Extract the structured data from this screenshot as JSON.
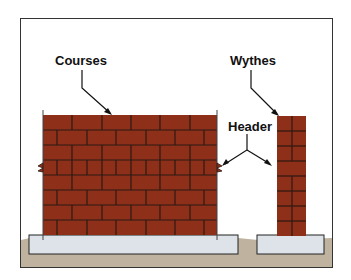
{
  "diagram": {
    "labels": {
      "courses": "Courses",
      "wythes": "Wythes",
      "header": "Header"
    },
    "colors": {
      "brick": "#8e2f1a",
      "mortar": "#2a1a12",
      "footing": "#dde3e8",
      "ground": "#bfb3a0",
      "frame": "#333333"
    },
    "wall": {
      "courses": 8
    },
    "column": {
      "courses": 8
    }
  }
}
